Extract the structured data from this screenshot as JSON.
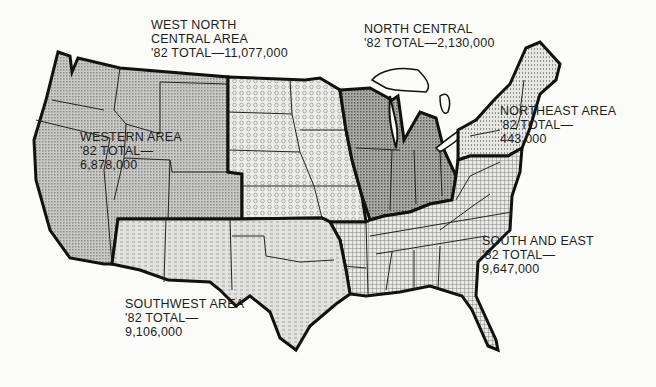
{
  "map": {
    "title": "",
    "regions": [
      {
        "id": "western",
        "name_lines": [
          "WESTERN AREA",
          "'82 TOTAL—",
          "6,878,000"
        ],
        "total": 6878000,
        "pattern": "fine-dots"
      },
      {
        "id": "west-north-central",
        "name_lines": [
          "WEST NORTH",
          "CENTRAL AREA",
          "'82 TOTAL—11,077,000"
        ],
        "total": 11077000,
        "pattern": "circles"
      },
      {
        "id": "north-central",
        "name_lines": [
          "NORTH CENTRAL",
          "'82 TOTAL—2,130,000"
        ],
        "total": 2130000,
        "pattern": "dark-dots"
      },
      {
        "id": "northeast",
        "name_lines": [
          "NORTHEAST AREA",
          "'82 TOTAL—",
          "443,000"
        ],
        "total": 443000,
        "pattern": "vertical-dots"
      },
      {
        "id": "south-and-east",
        "name_lines": [
          "SOUTH AND EAST",
          "'82 TOTAL—",
          "9,647,000"
        ],
        "total": 9647000,
        "pattern": "grid"
      },
      {
        "id": "southwest",
        "name_lines": [
          "SOUTHWEST AREA",
          "'82 TOTAL—",
          "9,106,000"
        ],
        "total": 9106000,
        "pattern": "dashes"
      }
    ]
  }
}
